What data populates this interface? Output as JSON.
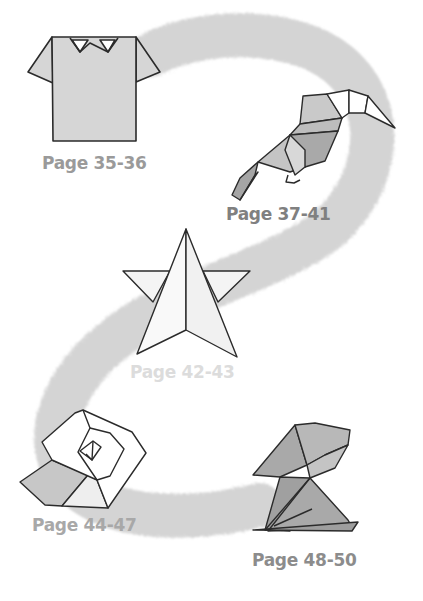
{
  "colors": {
    "background": "#ffffff",
    "path": "#d4d4d4",
    "outline": "#2b2b2b",
    "fill_light": "#f4f4f4",
    "fill_mid": "#c9c9c9",
    "fill_dark": "#a9a9a9"
  },
  "items": [
    {
      "name": "shirt",
      "label": "Page 35-36",
      "label_color": "#9a9a9a"
    },
    {
      "name": "toucan",
      "label": "Page 37-41",
      "label_color": "#808080"
    },
    {
      "name": "star",
      "label": "Page 42-43",
      "label_color": "#dcdcdc"
    },
    {
      "name": "rose",
      "label": "Page 44-47",
      "label_color": "#a8a8a8"
    },
    {
      "name": "rabbit",
      "label": "Page 48-50",
      "label_color": "#8c8c8c"
    }
  ]
}
